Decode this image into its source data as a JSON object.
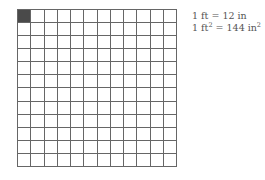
{
  "diagram": {
    "grid": {
      "rows": 12,
      "cols": 12,
      "shaded_cells": [
        [
          0,
          0
        ]
      ],
      "line_color": "#666666",
      "shade_color": "#4a4a4a"
    },
    "legend": {
      "line1": {
        "lhs": "1 ft = 12 in"
      },
      "line2": {
        "lhs_num": "1 ft",
        "lhs_exp": "2",
        "mid": " = 144 in",
        "rhs_exp": "2"
      }
    }
  }
}
